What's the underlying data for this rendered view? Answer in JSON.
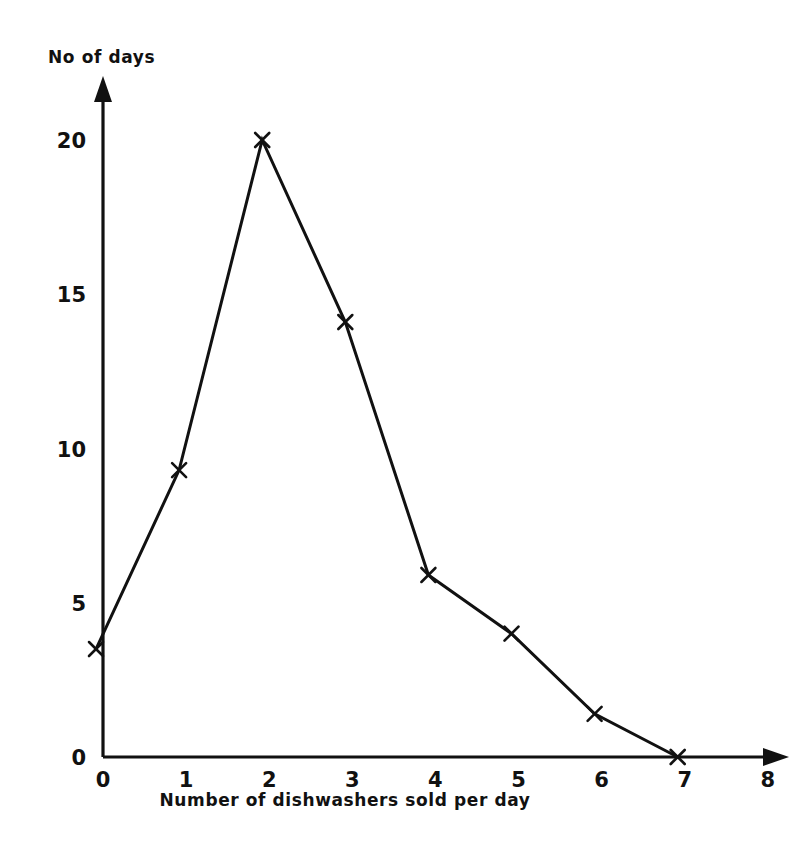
{
  "chart_data": {
    "type": "line",
    "title": "",
    "subtitle": "",
    "xlabel": "Number of dishwashers sold per day",
    "ylabel": "No of days",
    "x": [
      0,
      1,
      2,
      3,
      4,
      5,
      6,
      7
    ],
    "values": [
      3.5,
      9.3,
      20,
      14.1,
      5.9,
      4.0,
      1.4,
      0
    ],
    "series": [
      {
        "name": "No of days",
        "values": [
          3.5,
          9.3,
          20,
          14.1,
          5.9,
          4.0,
          1.4,
          0
        ]
      }
    ],
    "xlim": [
      0,
      8
    ],
    "ylim": [
      0,
      22
    ],
    "xticks": [
      0,
      1,
      2,
      3,
      4,
      5,
      6,
      7,
      8
    ],
    "yticks": [
      0,
      5,
      10,
      15,
      20
    ],
    "xtick_labels": [
      "0",
      "1",
      "2",
      "3",
      "4",
      "5",
      "6",
      "7",
      "8"
    ],
    "ytick_labels": [
      "0",
      "5",
      "10",
      "15",
      "20"
    ],
    "grid": false,
    "legend": false,
    "legend_position": "none",
    "marker": "x",
    "line_color": "#111111",
    "background_color": "#ffffff",
    "annotations": []
  },
  "axes": {
    "y_axis_title": "No of days",
    "x_axis_title": "Number of dishwashers sold per day"
  }
}
